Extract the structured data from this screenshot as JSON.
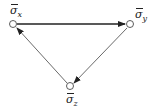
{
  "diagram": {
    "type": "directed-graph",
    "nodes": [
      {
        "id": "x",
        "label_symbol": "σ",
        "label_sub": "x",
        "label": "σ̄x",
        "cx": 13,
        "cy": 24
      },
      {
        "id": "y",
        "label_symbol": "σ",
        "label_sub": "y",
        "label": "σ̄y",
        "cx": 130,
        "cy": 24
      },
      {
        "id": "z",
        "label_symbol": "σ",
        "label_sub": "z",
        "label": "σ̄z",
        "cx": 70,
        "cy": 86
      }
    ],
    "edges": [
      {
        "from": "x",
        "to": "y",
        "weight": "bold"
      },
      {
        "from": "y",
        "to": "z",
        "weight": "thin"
      },
      {
        "from": "z",
        "to": "x",
        "weight": "thin"
      }
    ],
    "colors": {
      "stroke": "#222222",
      "node_fill": "#ffffff"
    }
  }
}
